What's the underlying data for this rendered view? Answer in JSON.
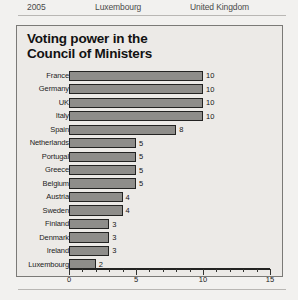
{
  "page_header": {
    "year": "2005",
    "middle": "Luxembourg",
    "right": "United Kingdom"
  },
  "chart_data": {
    "type": "bar",
    "orientation": "horizontal",
    "title": "Voting power in the Council of Ministers",
    "title_line1": "Voting power in the",
    "title_line2": "Council of Ministers",
    "xlabel": "",
    "ylabel": "",
    "xlim": [
      0,
      15
    ],
    "xticks": [
      0,
      5,
      10,
      15
    ],
    "xtick_labels": [
      "0",
      "5",
      "10",
      "15"
    ],
    "minor_tick_step": 1,
    "grid": false,
    "legend": false,
    "bar_color": "#8e8d8a",
    "bar_border_color": "#232322",
    "categories": [
      "France",
      "Germany",
      "UK",
      "Italy",
      "Spain",
      "Netherlands",
      "Portugal",
      "Greece",
      "Belgium",
      "Austria",
      "Sweden",
      "Finland",
      "Denmark",
      "Ireland",
      "Luxembourg"
    ],
    "values": [
      10,
      10,
      10,
      10,
      8,
      5,
      5,
      5,
      5,
      4,
      4,
      3,
      3,
      3,
      2
    ],
    "value_labels": [
      "10",
      "10",
      "10",
      "10",
      "8",
      "5",
      "5",
      "5",
      "5",
      "4",
      "4",
      "3",
      "3",
      "3",
      "2"
    ]
  }
}
